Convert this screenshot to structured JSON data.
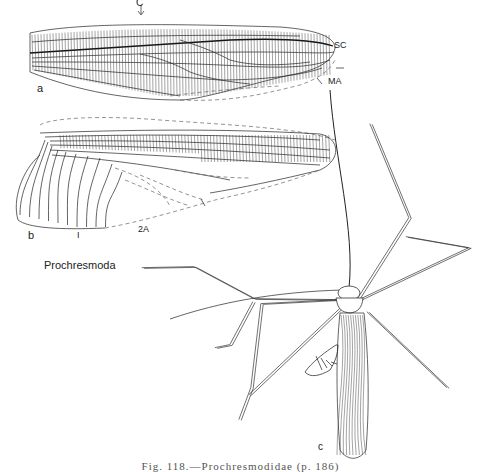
{
  "figure": {
    "genus_label": "Prochresmoda",
    "caption": "Fig. 118.—Prochresmodidae (p. 186)",
    "panels": {
      "a": "a",
      "b": "b",
      "c": "c"
    },
    "vein_labels": {
      "costa": "C",
      "subcosta": "SC",
      "media_anterior": "MA",
      "second_anal": "2A",
      "first_anal": "I"
    },
    "panel_descriptions": {
      "a": "forewing",
      "b": "hindwing",
      "c": "whole insect, dorsal view"
    }
  }
}
